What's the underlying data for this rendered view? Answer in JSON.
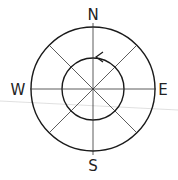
{
  "diagram": {
    "type": "compass-rose",
    "labels": {
      "north": "N",
      "east": "E",
      "south": "S",
      "west": "W"
    },
    "circles": {
      "outer_radius": 62,
      "inner_radius": 31
    },
    "arrow": {
      "direction": "counter-clockwise",
      "on": "inner-circle"
    },
    "colors": {
      "stroke": "#1a1a1a",
      "guide_line": "#cccccc"
    }
  }
}
